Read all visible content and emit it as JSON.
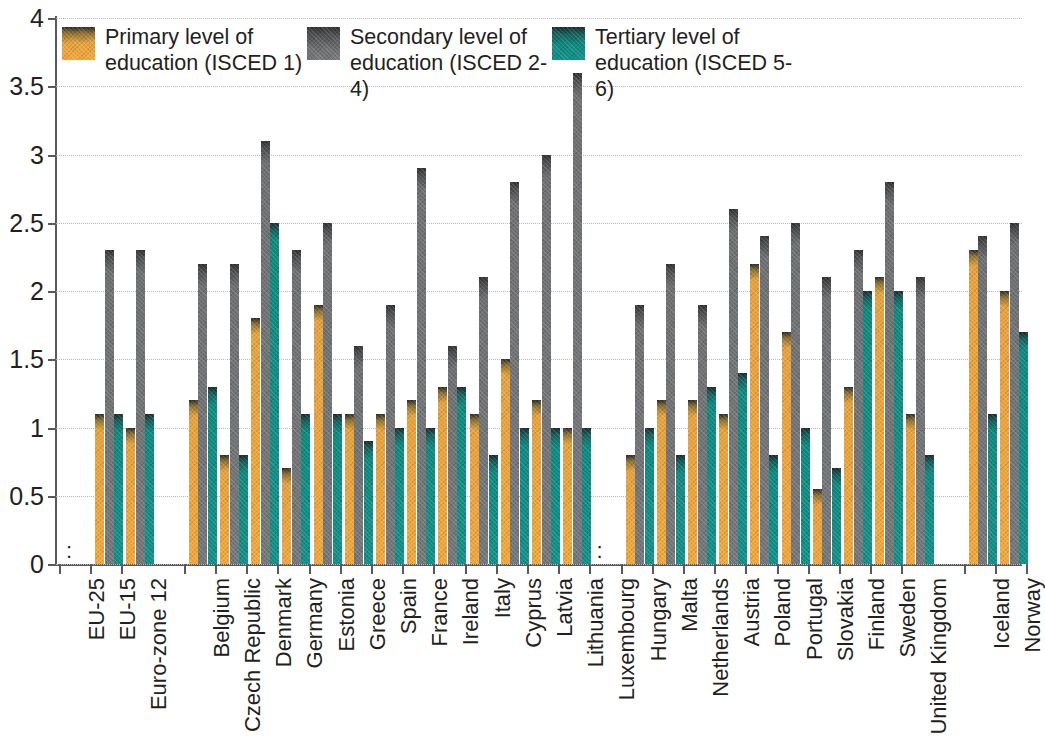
{
  "chart_data": {
    "type": "bar",
    "title": "",
    "subtitle": "",
    "xlabel": "",
    "ylabel": "",
    "ylim": [
      0,
      4
    ],
    "ytick_values": [
      0,
      0.5,
      1,
      1.5,
      2,
      2.5,
      3,
      3.5,
      4
    ],
    "ytick_labels": [
      "0",
      "0.5",
      "1",
      "1.5",
      "2",
      "2.5",
      "3",
      "3.5",
      "4"
    ],
    "grid": true,
    "legend_position": "top-inside",
    "no_data_marker": ":",
    "colors": {
      "primary": "#f2a93c",
      "secondary": "#75787b",
      "tertiary": "#11918a",
      "axis": "#58595b",
      "grid": "#b9b9b9",
      "text": "#231f20"
    },
    "series": [
      {
        "name": "Primary level of education (ISCED 1)",
        "key": "primary",
        "color": "#f2a93c"
      },
      {
        "name": "Secondary level of education (ISCED 2-4)",
        "key": "secondary",
        "color": "#75787b"
      },
      {
        "name": "Tertiary level of education (ISCED 5-6)",
        "key": "tertiary",
        "color": "#11918a"
      }
    ],
    "categories": [
      "EU-25",
      "EU-15",
      "Euro-zone 12",
      "Belgium",
      "Czech Republic",
      "Denmark",
      "Germany",
      "Estonia",
      "Greece",
      "Spain",
      "France",
      "Ireland",
      "Italy",
      "Cyprus",
      "Latvia",
      "Lithuania",
      "Luxembourg",
      "Hungary",
      "Malta",
      "Netherlands",
      "Austria",
      "Poland",
      "Portugal",
      "Slovakia",
      "Finland",
      "Sweden",
      "United Kingdom",
      "Iceland",
      "Norway"
    ],
    "group_gaps_after": [
      "Euro-zone 12",
      "United Kingdom"
    ],
    "values": {
      "primary": [
        null,
        1.1,
        1.0,
        1.2,
        0.8,
        1.8,
        0.7,
        1.9,
        1.1,
        1.1,
        1.2,
        1.3,
        1.1,
        1.5,
        1.2,
        1.0,
        null,
        0.8,
        1.2,
        1.2,
        1.1,
        2.2,
        1.7,
        0.55,
        1.3,
        2.1,
        1.1,
        2.3,
        2.0
      ],
      "secondary": [
        null,
        2.3,
        2.3,
        2.2,
        2.2,
        3.1,
        2.3,
        2.5,
        1.6,
        1.9,
        2.9,
        1.6,
        2.1,
        2.8,
        3.0,
        3.6,
        null,
        1.9,
        2.2,
        1.9,
        2.6,
        2.4,
        2.5,
        2.1,
        2.3,
        2.8,
        2.1,
        2.4,
        2.5
      ],
      "tertiary": [
        null,
        1.1,
        1.1,
        1.3,
        0.8,
        2.5,
        1.1,
        1.1,
        0.9,
        1.0,
        1.0,
        1.3,
        0.8,
        1.0,
        1.0,
        1.0,
        null,
        1.0,
        0.8,
        1.3,
        1.4,
        0.8,
        1.0,
        0.7,
        2.0,
        2.0,
        0.8,
        1.1,
        1.7
      ]
    }
  },
  "legend": {
    "items": [
      {
        "label": "Primary level of\neducation (ISCED 1)"
      },
      {
        "label": "Secondary level of\neducation (ISCED 2-4)"
      },
      {
        "label": "Tertiary level of\neducation (ISCED 5-6)"
      }
    ]
  }
}
